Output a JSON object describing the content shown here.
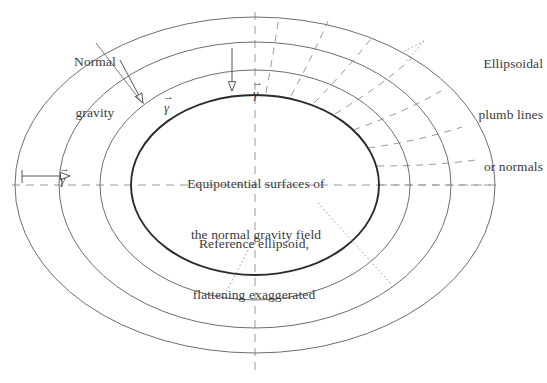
{
  "figure": {
    "background_color": "#ffffff",
    "line_color": "#555555",
    "thick_line_color": "#2b2b2b",
    "dash_color": "#8a8a8a",
    "text_color": "#3b3b3b",
    "width": 547,
    "height": 383
  },
  "labels": {
    "normal_gravity": {
      "line1": "Normal",
      "line2": "gravity"
    },
    "plumb_lines": {
      "line1": "Ellipsoidal",
      "line2": "plumb lines",
      "line3": "or normals"
    },
    "equipotential": {
      "line1": "Equipotential surfaces of",
      "line2": "the normal gravity field"
    },
    "reference_ellipsoid": {
      "line1": "Reference ellipsoid,",
      "line2": "flattening exaggerated"
    }
  },
  "vectors": [
    {
      "id": "gamma-upper-left",
      "symbol": "γ",
      "notation": "vector",
      "direction": "down-right"
    },
    {
      "id": "gamma-upper-mid",
      "symbol": "γ",
      "notation": "vector",
      "direction": "down"
    },
    {
      "id": "gamma-left",
      "symbol": "γ",
      "notation": "vector",
      "direction": "right"
    }
  ],
  "geometry": {
    "center": {
      "x": 255,
      "y": 185
    },
    "ellipses": [
      {
        "name": "reference-ellipsoid",
        "rx": 124,
        "ry": 90,
        "stroke": "thick"
      },
      {
        "name": "equipotential-1",
        "rx": 155,
        "ry": 115,
        "stroke": "thin"
      },
      {
        "name": "equipotential-2",
        "rx": 196,
        "ry": 143,
        "stroke": "thin"
      },
      {
        "name": "equipotential-3",
        "rx": 240,
        "ry": 168,
        "stroke": "thin"
      }
    ],
    "axes": {
      "horizontal": true,
      "vertical": true,
      "style": "dashed"
    },
    "plumb_line_count": 8,
    "plumb_line_quadrant": "upper-right"
  }
}
